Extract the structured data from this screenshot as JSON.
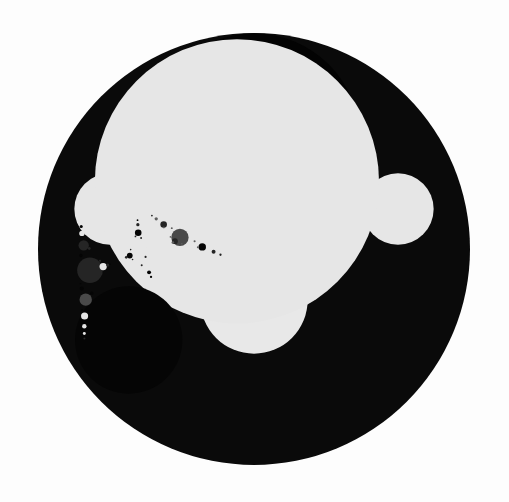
{
  "image": {
    "width": 509,
    "height": 502,
    "background": "#fdfdfd",
    "subject": "Apollonian gasket fractal"
  },
  "palette": {
    "black": "#050505",
    "dark": "#252525",
    "mid": "#4a4a4a",
    "midlight": "#5e5e5e",
    "light": "#e6e6e6",
    "gap": "#0a0a0a"
  },
  "outer_circle": {
    "cx": 254,
    "cy": 249,
    "r": 216,
    "fill": "#0a0a0a"
  },
  "seed_circles": [
    {
      "name": "top-black",
      "cx": 254,
      "cy": 139,
      "r": 106,
      "fill": "#030303"
    },
    {
      "name": "center-white",
      "cx": 254,
      "cy": 300,
      "r": 54,
      "fill": "#e8e8e8"
    }
  ],
  "min_radius": 1.1
}
